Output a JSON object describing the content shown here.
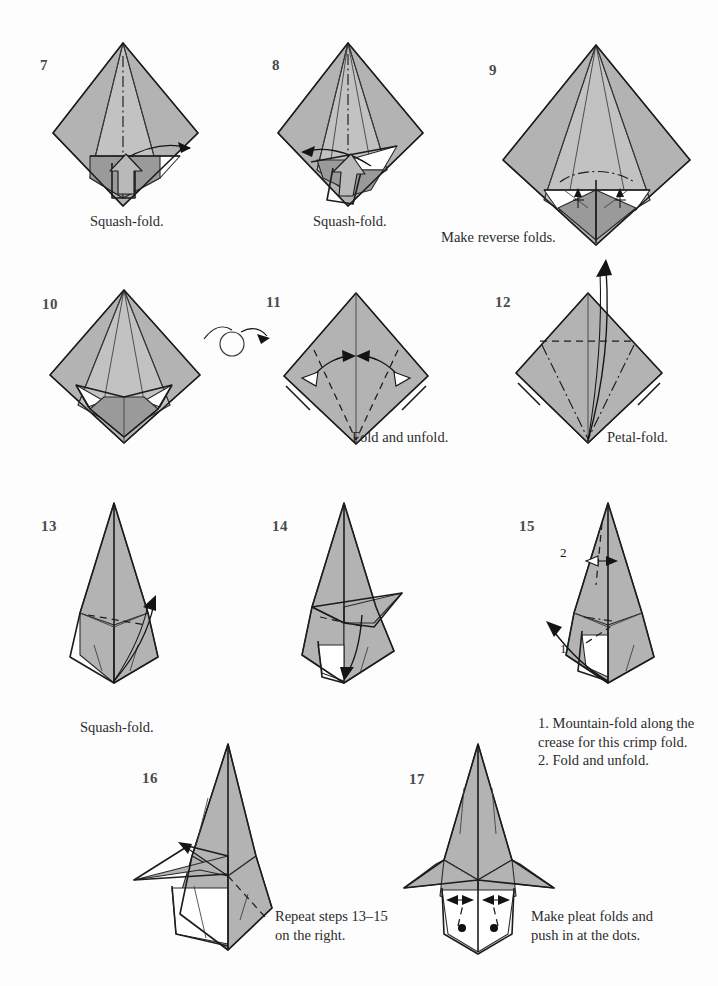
{
  "page": {
    "kind": "origami-instruction-diagram",
    "background_color": "#fdfdfd",
    "paper_front_color": "#b3b3b3",
    "paper_back_color": "#ffffff",
    "line_color": "#1c1c1c",
    "step_number_color": "#4b4b4b",
    "caption_color": "#2b2b2b",
    "step_range": "7-17"
  },
  "steps": [
    {
      "number": "7",
      "caption": "Squash-fold."
    },
    {
      "number": "8",
      "caption": "Squash-fold."
    },
    {
      "number": "9",
      "caption": "Make reverse folds."
    },
    {
      "number": "10",
      "caption": ""
    },
    {
      "number": "11",
      "caption": "Fold and unfold."
    },
    {
      "number": "12",
      "caption": "Petal-fold."
    },
    {
      "number": "13",
      "caption": "Squash-fold."
    },
    {
      "number": "14",
      "caption": ""
    },
    {
      "number": "15",
      "caption": "1. Mountain-fold along the\n    crease for this crimp fold.\n2. Fold and unfold."
    },
    {
      "number": "16",
      "caption": "Repeat steps 13–15\non the right."
    },
    {
      "number": "17",
      "caption": "Make pleat folds and\npush in at the dots."
    }
  ],
  "inline_labels": {
    "step15_label_1": "1",
    "step15_label_2": "2"
  },
  "symbols": {
    "turn_over": "turn-over-arrow",
    "push_arrow": "squash-push-arrow",
    "fold_arrow": "fold-arrow",
    "valley_fold": "dashed-line",
    "mountain_fold": "dash-dot-line",
    "push_dot": "black-dot"
  }
}
